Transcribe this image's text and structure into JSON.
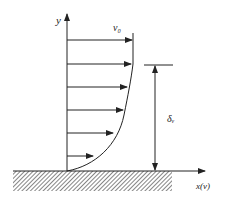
{
  "diagram": {
    "type": "boundary-layer velocity profile",
    "labels": {
      "y_axis": "y",
      "free_stream_velocity": "v₀",
      "boundary_layer_thickness": "δᵥ",
      "x_axis": "x(v)"
    },
    "colors": {
      "line": "#222222",
      "background": "#ffffff"
    },
    "velocity_arrows": [
      {
        "y": 40,
        "x_end": 132
      },
      {
        "y": 64,
        "x_end": 131
      },
      {
        "y": 87,
        "x_end": 127
      },
      {
        "y": 110,
        "x_end": 123
      },
      {
        "y": 133,
        "x_end": 113
      },
      {
        "y": 156,
        "x_end": 94
      }
    ]
  }
}
